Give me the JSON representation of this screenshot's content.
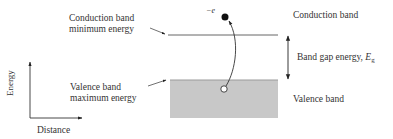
{
  "diagram": {
    "labels": {
      "cb_min_line1": "Conduction band",
      "cb_min_line2": "minimum energy",
      "vb_max_line1": "Valence band",
      "vb_max_line2": "maximum energy",
      "conduction_band": "Conduction band",
      "valence_band": "Valence band",
      "band_gap_prefix": "Band gap energy, ",
      "band_gap_symbol": "E",
      "band_gap_subscript": "g",
      "electron": "−e",
      "axis_y": "Energy",
      "axis_x": "Distance"
    },
    "colors": {
      "line": "#333333",
      "valence_fill": "#c8c8c8",
      "electron": "#111111",
      "hole_fill": "#ffffff"
    },
    "elements": {
      "conduction_band_line": {
        "x1": 168,
        "x2": 278,
        "y": 35
      },
      "valence_band_rect": {
        "x": 170,
        "y": 80,
        "width": 108,
        "height": 38
      },
      "electron": {
        "cx": 225,
        "cy": 17,
        "r": 3.5
      },
      "hole": {
        "cx": 224,
        "cy": 89,
        "r": 3.2
      },
      "band_gap_arrow": {
        "x": 288,
        "y1": 35,
        "y2": 80
      }
    }
  }
}
